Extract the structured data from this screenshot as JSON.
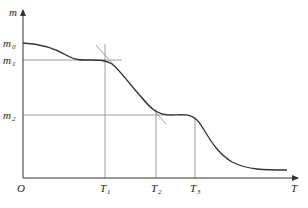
{
  "diagram": {
    "type": "thermogravimetric curve (mass vs temperature)",
    "axes": {
      "y_label": "m",
      "x_label": "T",
      "origin_label": "O"
    },
    "y_ticks": [
      {
        "base": "m",
        "sub": "0"
      },
      {
        "base": "m",
        "sub": "1"
      },
      {
        "base": "m",
        "sub": "2"
      }
    ],
    "x_ticks": [
      {
        "base": "T",
        "sub": "1"
      },
      {
        "base": "T",
        "sub": "2"
      },
      {
        "base": "T",
        "sub": "3"
      }
    ],
    "colors": {
      "curve": "#333333",
      "axis": "#333333",
      "guide": "#888888"
    }
  }
}
